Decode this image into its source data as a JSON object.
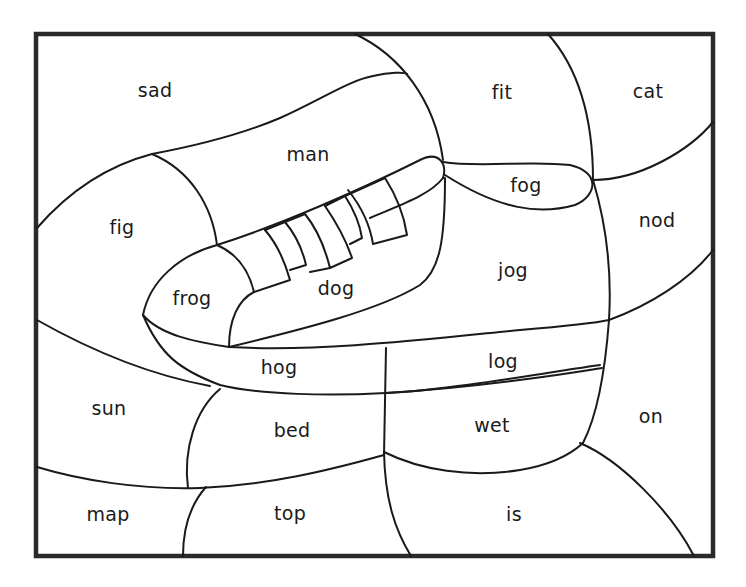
{
  "worksheet": {
    "type": "color-by-word picture (sneaker)",
    "frame_color": "#2a2a2a",
    "line_color": "#1a1a1a",
    "background": "#ffffff",
    "regions": [
      {
        "id": "sad",
        "word": "sad",
        "x": 155,
        "y": 90
      },
      {
        "id": "man",
        "word": "man",
        "x": 308,
        "y": 154
      },
      {
        "id": "fit",
        "word": "fit",
        "x": 502,
        "y": 92
      },
      {
        "id": "cat",
        "word": "cat",
        "x": 648,
        "y": 91
      },
      {
        "id": "fig",
        "word": "fig",
        "x": 122,
        "y": 227
      },
      {
        "id": "fog",
        "word": "fog",
        "x": 526,
        "y": 185
      },
      {
        "id": "nod",
        "word": "nod",
        "x": 657,
        "y": 220
      },
      {
        "id": "frog",
        "word": "frog",
        "x": 192,
        "y": 298
      },
      {
        "id": "dog",
        "word": "dog",
        "x": 336,
        "y": 288
      },
      {
        "id": "jog",
        "word": "jog",
        "x": 513,
        "y": 270
      },
      {
        "id": "hog",
        "word": "hog",
        "x": 279,
        "y": 367
      },
      {
        "id": "log",
        "word": "log",
        "x": 503,
        "y": 361
      },
      {
        "id": "sun",
        "word": "sun",
        "x": 109,
        "y": 408
      },
      {
        "id": "bed",
        "word": "bed",
        "x": 292,
        "y": 430
      },
      {
        "id": "wet",
        "word": "wet",
        "x": 492,
        "y": 425
      },
      {
        "id": "on",
        "word": "on",
        "x": 651,
        "y": 416
      },
      {
        "id": "map",
        "word": "map",
        "x": 108,
        "y": 514
      },
      {
        "id": "top",
        "word": "top",
        "x": 290,
        "y": 513
      },
      {
        "id": "is",
        "word": "is",
        "x": 514,
        "y": 514
      }
    ]
  }
}
